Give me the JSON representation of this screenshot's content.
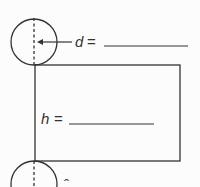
{
  "figure": {
    "type": "cylinder-net",
    "labels": {
      "diameter_var": "d",
      "height_var": "h",
      "equals": "="
    },
    "answers": {
      "diameter_blank": "",
      "height_blank": ""
    },
    "colors": {
      "stroke": "#333333",
      "background": "#fcfcfc"
    }
  }
}
